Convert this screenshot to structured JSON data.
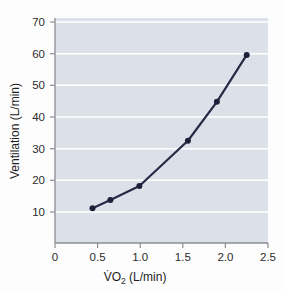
{
  "chart_data": {
    "type": "line",
    "title": "",
    "xlabel": "V̇O₂ (L/min)",
    "ylabel": "Ventilation (L/min)",
    "xlim": [
      0,
      2.5
    ],
    "ylim": [
      0,
      72
    ],
    "grid": "horizontal",
    "legend": "none",
    "x": [
      0.44,
      0.65,
      0.99,
      1.56,
      1.9,
      2.25
    ],
    "values": [
      11.2,
      13.8,
      18.2,
      32.5,
      44.8,
      59.6
    ],
    "series": [
      {
        "name": "Ventilation vs VO2",
        "x": [
          0.44,
          0.65,
          0.99,
          1.56,
          1.9,
          2.25
        ],
        "values": [
          11.2,
          13.8,
          18.2,
          32.5,
          44.8,
          59.6
        ]
      }
    ],
    "xticks": [
      0,
      0.5,
      1.0,
      1.5,
      2.0,
      2.5
    ],
    "xtick_labels": [
      "0",
      "0.5",
      "1.0",
      "1.5",
      "2.0",
      "2.5"
    ],
    "yticks": [
      10,
      20,
      30,
      40,
      50,
      60,
      70
    ],
    "ytick_labels": [
      "10",
      "20",
      "30",
      "40",
      "50",
      "60",
      "70"
    ],
    "colors": {
      "plot_background": "#dce0e8",
      "gridline": "#ffffff",
      "line": "#252a45",
      "marker": "#1c2038",
      "axis": "#8d8d93",
      "text": "#2b2b2b",
      "page_background": "#fdfdfd"
    }
  },
  "axis_titles": {
    "y": "Ventilation (L/min)",
    "x_prefix": "V̇O",
    "x_subscript": "2",
    "x_suffix": " (L/min)"
  }
}
